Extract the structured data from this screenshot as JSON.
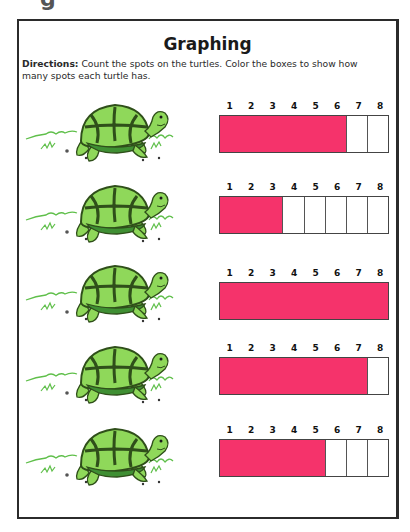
{
  "page": {
    "title": "Graphing",
    "directions_label": "Directions:",
    "directions_text": " Count the spots on the turtles. Color the boxes to show how many spots each turtle has.",
    "clipped_glyph": "g"
  },
  "graph": {
    "scale": [
      "1",
      "2",
      "3",
      "4",
      "5",
      "6",
      "7",
      "8"
    ],
    "fill_color": "#f5336b",
    "rows": [
      {
        "turtle": "turtle-1",
        "filled": 6
      },
      {
        "turtle": "turtle-2",
        "filled": 3
      },
      {
        "turtle": "turtle-3",
        "filled": 8
      },
      {
        "turtle": "turtle-4",
        "filled": 7
      },
      {
        "turtle": "turtle-5",
        "filled": 5
      }
    ]
  }
}
